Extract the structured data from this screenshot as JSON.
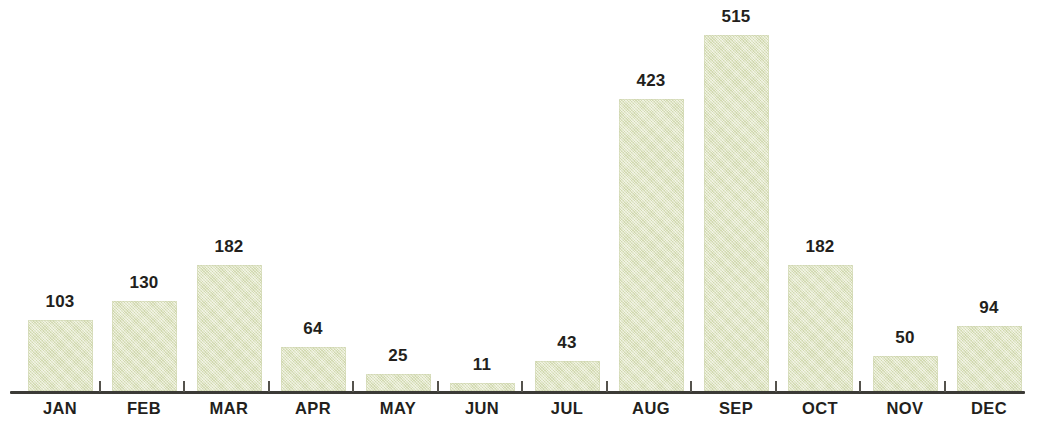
{
  "chart_data": {
    "type": "bar",
    "title": "",
    "subtitle": "",
    "xlabel": "",
    "ylabel": "",
    "categories": [
      "JAN",
      "FEB",
      "MAR",
      "APR",
      "MAY",
      "JUN",
      "JUL",
      "AUG",
      "SEP",
      "OCT",
      "NOV",
      "DEC"
    ],
    "values": [
      103,
      130,
      182,
      64,
      25,
      11,
      43,
      423,
      515,
      182,
      50,
      94
    ],
    "value_labels": [
      "103",
      "130",
      "182",
      "64",
      "25",
      "11",
      "43",
      "423",
      "515",
      "182",
      "50",
      "94"
    ],
    "ylim": [
      0,
      515
    ],
    "grid": false,
    "legend": false,
    "legend_position": "none",
    "data_labels_shown": true,
    "axis_ticks_between_categories": true,
    "bar_color": "#dde3bc",
    "axis_color": "#3b3a36",
    "tick_color": "#55534d",
    "label_color": "#231f1c"
  }
}
